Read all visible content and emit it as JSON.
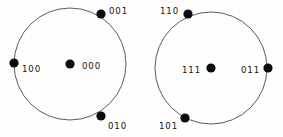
{
  "figure": {
    "type": "state-orbit-diagram",
    "width": 283,
    "height": 137,
    "background_color": "#fefefe",
    "stroke_color": "#4a4a4a",
    "dot_color": "#0d0d0d",
    "label_color": "#121212",
    "groups": [
      {
        "id": "left-orbit",
        "name": "orbit-000",
        "center_x": 70,
        "center_y": 64,
        "radius": 56,
        "center_node": {
          "label": "000",
          "dot_x": 70,
          "dot_y": 64,
          "dot_r": 4.6,
          "label_x": 82,
          "label_y": 66,
          "anchor": "start"
        },
        "orbit_nodes": [
          {
            "label": "001",
            "dot_x": 101,
            "dot_y": 14,
            "dot_r": 4.6,
            "label_x": 109,
            "label_y": 11,
            "anchor": "start"
          },
          {
            "label": "100",
            "dot_x": 14,
            "dot_y": 63,
            "dot_r": 4.6,
            "label_x": 22,
            "label_y": 69,
            "anchor": "start"
          },
          {
            "label": "010",
            "dot_x": 101,
            "dot_y": 116,
            "dot_r": 4.6,
            "label_x": 108,
            "label_y": 126,
            "anchor": "start"
          }
        ]
      },
      {
        "id": "right-orbit",
        "name": "orbit-111",
        "center_x": 211,
        "center_y": 68,
        "radius": 56,
        "center_node": {
          "label": "111",
          "dot_x": 211,
          "dot_y": 68,
          "dot_r": 4.6,
          "label_x": 201,
          "label_y": 70,
          "anchor": "end"
        },
        "orbit_nodes": [
          {
            "label": "110",
            "dot_x": 188,
            "dot_y": 14,
            "dot_r": 4.6,
            "label_x": 179,
            "label_y": 11,
            "anchor": "end"
          },
          {
            "label": "011",
            "dot_x": 268,
            "dot_y": 68,
            "dot_r": 4.6,
            "label_x": 260,
            "label_y": 70,
            "anchor": "end"
          },
          {
            "label": "101",
            "dot_x": 185,
            "dot_y": 118,
            "dot_r": 4.6,
            "label_x": 178,
            "label_y": 126,
            "anchor": "end"
          }
        ]
      }
    ]
  }
}
